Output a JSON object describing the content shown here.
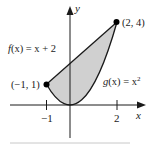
{
  "figure": {
    "axes": {
      "x_label": "x",
      "y_label": "y",
      "x_ticks": [
        {
          "value": -1,
          "label": "−1"
        },
        {
          "value": 2,
          "label": "2"
        }
      ]
    },
    "curves": [
      {
        "name": "f",
        "label_fn": "f",
        "label_arg": "(x)",
        "label_rhs": " = x + 2",
        "expression": "x + 2"
      },
      {
        "name": "g",
        "label_fn": "g",
        "label_arg": "(x)",
        "label_rhs": " = x",
        "label_sup": "2",
        "expression": "x^2"
      }
    ],
    "points": [
      {
        "label": "(−1, 1)",
        "x": -1,
        "y": 1
      },
      {
        "label": "(2, 4)",
        "x": 2,
        "y": 4
      }
    ],
    "region": {
      "description": "shaded region between f(x) and g(x) from x = -1 to x = 2",
      "fill": "#d0d0d0"
    },
    "colors": {
      "stroke": "#1a1a1a",
      "fill": "#d0d0d0",
      "baseline": "#c8c8c8"
    }
  }
}
